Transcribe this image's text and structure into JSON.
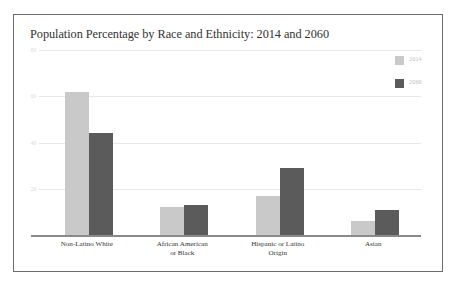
{
  "figure": {
    "title": "Population Percentage by Race and Ethnicity: 2014 and 2060",
    "border_color": "#6d6d6d",
    "background": "#ffffff"
  },
  "legend": {
    "position": "top-right",
    "entries": [
      {
        "label": "2014",
        "color": "#c9c9c9",
        "swatch_name": "legend-swatch-2014"
      },
      {
        "label": "2060",
        "color": "#5b5b5b",
        "swatch_name": "legend-swatch-2060"
      }
    ]
  },
  "chart_data": {
    "type": "bar",
    "title": "Population Percentage by Race and Ethnicity: 2014 and 2060",
    "xlabel": "",
    "ylabel": "",
    "ylim": [
      0,
      84
    ],
    "grid": true,
    "legend_position": "top-right",
    "categories": [
      "Non-Latino White",
      "African American or Black",
      "Hispanic or Latino Origin",
      "Asian"
    ],
    "category_label_lines": [
      [
        "Non-Latino White"
      ],
      [
        "African American",
        "or Black"
      ],
      [
        "Hispanic or Latino",
        "Origin"
      ],
      [
        "Asian"
      ]
    ],
    "yticks": [
      20,
      40,
      60,
      80
    ],
    "ytick_labels": [
      "20",
      "40",
      "60",
      "80"
    ],
    "series": [
      {
        "name": "2014",
        "color": "#c9c9c9",
        "values": [
          62,
          12,
          17,
          6
        ]
      },
      {
        "name": "2060",
        "color": "#5b5b5b",
        "values": [
          44,
          13,
          29,
          11
        ]
      }
    ]
  }
}
